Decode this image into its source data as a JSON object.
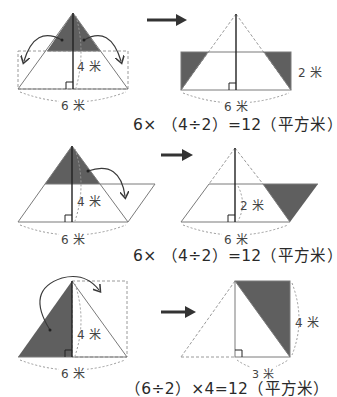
{
  "colors": {
    "shade": "#5f5f5f",
    "line": "#7a7a7a",
    "height_line": "#222222",
    "dashed": "#9a9a9a",
    "arrow": "#3a3a3a",
    "text": "#2a2a2a"
  },
  "rows": [
    {
      "left": {
        "height_label": "4 米",
        "base_label": "6 米"
      },
      "right": {
        "side_label": "2 米",
        "base_label": "6 米"
      },
      "formula": "6× （4÷2）=12（平方米）"
    },
    {
      "left": {
        "height_label": "4 米",
        "base_label": "6 米"
      },
      "right": {
        "height_label": "2 米",
        "base_label": "6 米"
      },
      "formula": "6× （4÷2）=12（平方米）"
    },
    {
      "left": {
        "height_label": "4 米",
        "base_label": "6 米"
      },
      "right": {
        "side_label": "4 米",
        "base_label": "3 米"
      },
      "formula": "（6÷2）×4=12（平方米）"
    }
  ]
}
